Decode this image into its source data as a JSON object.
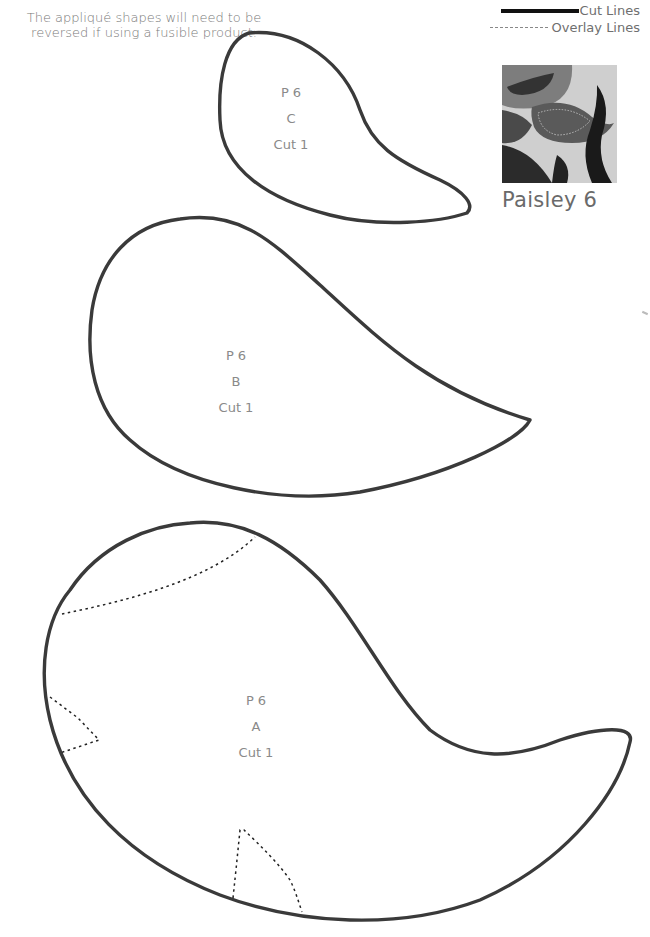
{
  "note": {
    "line1": "The appliqué shapes will need to be",
    "line2": "reversed if using a fusible product."
  },
  "legend": {
    "cut_lines": "Cut Lines",
    "overlay_lines": "Overlay Lines"
  },
  "photo": {
    "caption": "Paisley 6"
  },
  "pieces": [
    {
      "id": "C",
      "label_line1": "P 6",
      "label_line2": "C",
      "label_line3": "Cut 1"
    },
    {
      "id": "B",
      "label_line1": "P 6",
      "label_line2": "B",
      "label_line3": "Cut 1"
    },
    {
      "id": "A",
      "label_line1": "P 6",
      "label_line2": "A",
      "label_line3": "Cut 1"
    }
  ],
  "colors": {
    "cut_line": "#3a3a3a",
    "overlay_line": "#222222",
    "label_text": "#8a8a8a"
  }
}
